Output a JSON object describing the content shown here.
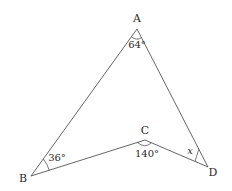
{
  "diagram": {
    "type": "geometry",
    "shape": "concave quadrilateral (dart) ABCD",
    "vertices": [
      {
        "id": "A",
        "label": "A",
        "x": 137,
        "y": 29,
        "label_x": 137,
        "label_y": 22
      },
      {
        "id": "B",
        "label": "B",
        "x": 31,
        "y": 176,
        "label_x": 23,
        "label_y": 182
      },
      {
        "id": "C",
        "label": "C",
        "x": 145,
        "y": 140,
        "label_x": 145,
        "label_y": 134
      },
      {
        "id": "D",
        "label": "D",
        "x": 208,
        "y": 167,
        "label_x": 213,
        "label_y": 176
      }
    ],
    "edges": [
      {
        "from": "A",
        "to": "B"
      },
      {
        "from": "B",
        "to": "C"
      },
      {
        "from": "C",
        "to": "D"
      },
      {
        "from": "D",
        "to": "A"
      }
    ],
    "angles": [
      {
        "vertex": "A",
        "label": "64°",
        "label_x": 137,
        "label_y": 48
      },
      {
        "vertex": "B",
        "label": "36°",
        "label_x": 57,
        "label_y": 161
      },
      {
        "vertex": "C",
        "label": "140°",
        "label_x": 147,
        "label_y": 157
      },
      {
        "vertex": "D",
        "label": "x",
        "label_x": 190,
        "label_y": 154
      }
    ],
    "colors": {
      "line": "#555555",
      "text": "#2a2a2a",
      "background": "#ffffff"
    }
  }
}
